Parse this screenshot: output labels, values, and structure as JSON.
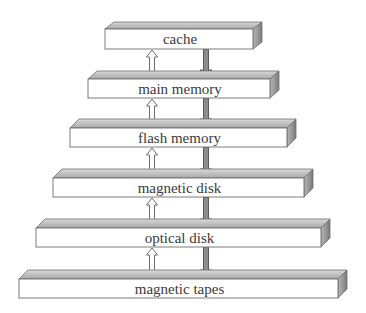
{
  "diagram": {
    "type": "storage-device-hierarchy",
    "colors": {
      "background": "#ffffff",
      "front_face": "#ffffff",
      "top_face_light": "#e4e4e4",
      "top_face_dark": "#a9a9a9",
      "side_face_light": "#b8b8b8",
      "side_face_dark": "#7a7a7a",
      "outline": "#6e6e6e",
      "text": "#3a3a3a",
      "down_arrow_fill": "#8c8c8c",
      "down_arrow_stroke": "#5a5a5a",
      "up_arrow_fill": "#ffffff",
      "up_arrow_stroke": "#6e6e6e"
    },
    "levels": [
      {
        "label": "cache",
        "x1": 105,
        "x2": 253,
        "top": 22,
        "front_top": 29,
        "bottom": 49
      },
      {
        "label": "main memory",
        "x1": 88,
        "x2": 270,
        "top": 71,
        "front_top": 79,
        "bottom": 98
      },
      {
        "label": "flash memory",
        "x1": 70,
        "x2": 287,
        "top": 119,
        "front_top": 128,
        "bottom": 147
      },
      {
        "label": "magnetic disk",
        "x1": 53,
        "x2": 304,
        "top": 169,
        "front_top": 178,
        "bottom": 197
      },
      {
        "label": "optical disk",
        "x1": 36,
        "x2": 321,
        "top": 219,
        "front_top": 228,
        "bottom": 247
      },
      {
        "label": "magnetic tapes",
        "x1": 19,
        "x2": 338,
        "top": 270,
        "front_top": 279,
        "bottom": 298
      }
    ],
    "depth_dx": 9,
    "arrows": {
      "up_x": 152,
      "down_x": 206,
      "up_label": "data moves up (hollow arrow)",
      "down_label": "data moves down (filled arrow)"
    }
  }
}
